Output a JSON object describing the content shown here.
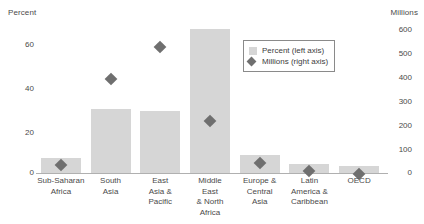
{
  "chart_data": {
    "type": "bar",
    "title": "",
    "categories": [
      "Sub-Saharan\nAfrica",
      "South\nAsia",
      "East\nAsia &\nPacific",
      "Middle\nEast\n& North\nAfrica",
      "Europe &\nCentral\nAsia",
      "Latin\nAmerica &\nCaribbean",
      "OECD"
    ],
    "series": [
      {
        "name": "Percent (left axis)",
        "axis": "left",
        "render": "bar",
        "values": [
          7,
          29,
          28,
          65,
          8,
          4,
          3
        ]
      },
      {
        "name": "Millions (right axis)",
        "axis": "right",
        "render": "marker",
        "values": [
          50,
          380,
          505,
          220,
          55,
          25,
          15
        ]
      }
    ],
    "xlabel": "",
    "ylabel": "Percent",
    "y2label": "Millions",
    "ylim": [
      0,
      70
    ],
    "y2lim": [
      0,
      600
    ],
    "yticks": [
      0,
      20,
      40,
      60
    ],
    "y2ticks": [
      0,
      100,
      200,
      300,
      400,
      500,
      600
    ],
    "grid": false,
    "legend_position": "top-right",
    "colors": {
      "bar": "#d6d6d6",
      "marker": "#6f6f6f",
      "text": "#4a4a4a",
      "axis": "#b0b0b0"
    }
  },
  "axes": {
    "left_title": "Percent",
    "right_title": "Millions",
    "left_ticks": [
      "60",
      "40",
      "20",
      "0"
    ],
    "right_ticks": [
      "600",
      "500",
      "400",
      "300",
      "200",
      "100",
      "0"
    ]
  },
  "legend": {
    "items": [
      {
        "label": "Percent (left axis)",
        "icon": "square-swatch"
      },
      {
        "label": "Millions (right axis)",
        "icon": "diamond-marker"
      }
    ]
  }
}
